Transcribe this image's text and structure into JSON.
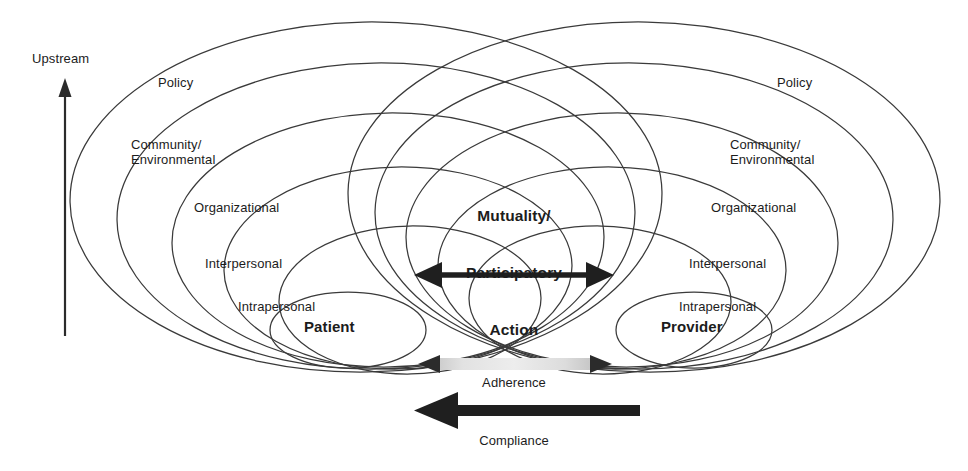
{
  "figure": {
    "type": "conceptual-diagram",
    "title_visible": false,
    "background_color": "#ffffff",
    "line_color": "#333333",
    "text_color": "#1c1c1c"
  },
  "axis": {
    "upstream_label": "Upstream",
    "arrow_direction": "up",
    "arrow_color": "#2b2b2b"
  },
  "levels": [
    "Policy",
    "Community/\nEnvironmental",
    "Organizational",
    "Interpersonal",
    "Intrapersonal"
  ],
  "left_system": {
    "actor": "Patient",
    "labels": {
      "policy": "Policy",
      "community": "Community/\nEnvironmental",
      "organizational": "Organizational",
      "interpersonal": "Interpersonal",
      "intrapersonal": "Intrapersonal"
    }
  },
  "right_system": {
    "actor": "Provider",
    "labels": {
      "policy": "Policy",
      "community": "Community/\nEnvironmental",
      "organizational": "Organizational",
      "interpersonal": "Interpersonal",
      "intrapersonal": "Intrapersonal"
    }
  },
  "center": {
    "label": "Mutuality/\nParticipatory\nAction",
    "line1": "Mutuality/",
    "line2": "Participatory",
    "line3": "Action",
    "arrow": {
      "name": "mutuality-arrow",
      "direction": "bidirectional",
      "color": "#1f1f1f"
    }
  },
  "flows": [
    {
      "label": "Adherence",
      "direction": "bidirectional",
      "bar_color": "#d9d9d9",
      "head_color": "#2b2b2b"
    },
    {
      "label": "Compliance",
      "direction": "left",
      "bar_color": "#1f1f1f",
      "head_color": "#1f1f1f"
    }
  ],
  "adherence": {
    "label": "Adherence"
  },
  "compliance": {
    "label": "Compliance"
  }
}
